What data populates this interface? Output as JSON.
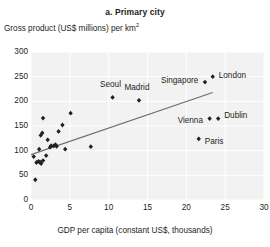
{
  "chart_data": {
    "type": "scatter",
    "title": "a. Primary city",
    "ylabel": "Gross product (US$ millions) per km²",
    "xlabel": "GDP per capita (constant US$, thousands)",
    "xlim": [
      0,
      30
    ],
    "ylim": [
      0,
      300
    ],
    "xticks": [
      0,
      5,
      10,
      15,
      20,
      25,
      30
    ],
    "yticks": [
      0,
      50,
      100,
      150,
      200,
      250,
      300
    ],
    "grid": true,
    "legend": "none",
    "point_color": "#231f20",
    "trendline_color": "#6d6e71",
    "plot_bg_color": "#f2f2f2",
    "gridline_color": "#ffffff",
    "trendline": {
      "x0": 0.0,
      "y0": 92,
      "x1": 23.4,
      "y1": 218
    },
    "labeled_points": [
      {
        "name": "Seoul",
        "x": 10.5,
        "y": 208,
        "label_dx": -2,
        "label_dy": -12,
        "label_align": "center"
      },
      {
        "name": "Madrid",
        "x": 13.9,
        "y": 202,
        "label_dx": -2,
        "label_dy": -12,
        "label_align": "center"
      },
      {
        "name": "Singapore",
        "x": 22.4,
        "y": 239,
        "label_dx": -7,
        "label_dy": -1,
        "label_align": "right"
      },
      {
        "name": "London",
        "x": 23.4,
        "y": 250,
        "label_dx": 6,
        "label_dy": -1,
        "label_align": "left"
      },
      {
        "name": "Vienna",
        "x": 23.0,
        "y": 165,
        "label_dx": -7,
        "label_dy": 2,
        "label_align": "right"
      },
      {
        "name": "Dublin",
        "x": 24.1,
        "y": 165,
        "label_dx": 6,
        "label_dy": -3,
        "label_align": "left"
      },
      {
        "name": "Paris",
        "x": 21.6,
        "y": 124,
        "label_dx": 6,
        "label_dy": 3,
        "label_align": "left"
      }
    ],
    "unlabeled_points": [
      {
        "x": 0.55,
        "y": 41
      },
      {
        "x": 0.7,
        "y": 76
      },
      {
        "x": 0.95,
        "y": 78
      },
      {
        "x": 1.15,
        "y": 77
      },
      {
        "x": 1.3,
        "y": 74
      },
      {
        "x": 1.55,
        "y": 80
      },
      {
        "x": 1.05,
        "y": 103
      },
      {
        "x": 1.25,
        "y": 131
      },
      {
        "x": 1.45,
        "y": 136
      },
      {
        "x": 1.55,
        "y": 166
      },
      {
        "x": 1.95,
        "y": 90
      },
      {
        "x": 2.45,
        "y": 107
      },
      {
        "x": 2.6,
        "y": 110
      },
      {
        "x": 2.95,
        "y": 110
      },
      {
        "x": 3.15,
        "y": 112
      },
      {
        "x": 3.3,
        "y": 109
      },
      {
        "x": 3.55,
        "y": 139
      },
      {
        "x": 4.05,
        "y": 152
      },
      {
        "x": 4.4,
        "y": 103
      },
      {
        "x": 5.1,
        "y": 176
      },
      {
        "x": 7.7,
        "y": 108
      },
      {
        "x": 0.35,
        "y": 88
      },
      {
        "x": 2.15,
        "y": 122
      }
    ]
  }
}
